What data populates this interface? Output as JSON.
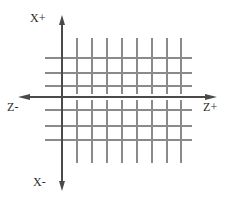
{
  "diagram": {
    "background_color": "#ffffff",
    "grid_color": "#8a8a8a",
    "axis_color": "#4a4a4a",
    "text_color": "#2b2b2b",
    "labels": {
      "x_positive": "X+",
      "x_negative": "X-",
      "z_negative": "Z-",
      "z_positive": "Z+"
    },
    "axes": {
      "vertical": {
        "name": "X axis",
        "x": 62,
        "y_top": 18,
        "y_bottom": 188,
        "arrow_top": true,
        "arrow_bottom": true
      },
      "horizontal": {
        "name": "Z axis",
        "y": 97,
        "x_left": 22,
        "x_right": 213,
        "arrow_left": true,
        "arrow_right": true
      }
    },
    "grid": {
      "vertical_line_x": [
        62,
        77,
        92,
        107,
        122,
        137,
        152,
        167,
        181
      ],
      "vertical_line_y_top": 38,
      "vertical_line_y_bottom": 163,
      "horizontal_line_y": [
        58,
        73,
        86,
        97,
        110,
        126,
        140
      ],
      "horizontal_line_x_left": 45,
      "horizontal_line_x_right": 192,
      "vertical_count": 9,
      "horizontal_count": 7
    }
  }
}
